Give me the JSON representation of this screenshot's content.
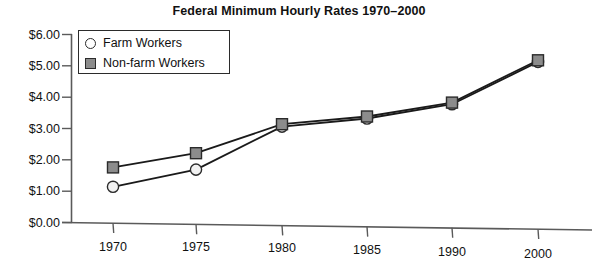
{
  "chart_data": {
    "type": "line",
    "title": "Federal Minimum Hourly Rates 1970–2000",
    "xlabel": "",
    "ylabel": "",
    "categories": [
      "1970",
      "1975",
      "1980",
      "1985",
      "1990",
      "2000"
    ],
    "series": [
      {
        "name": "Farm Workers",
        "marker": "open-circle",
        "marker_fill": "#f2f2f2",
        "marker_stroke": "#2b2b2b",
        "values": [
          1.3,
          1.8,
          3.1,
          3.35,
          3.8,
          5.15
        ]
      },
      {
        "name": "Non-farm Workers",
        "marker": "filled-square",
        "marker_fill": "#8c8c8c",
        "marker_stroke": "#2b2b2b",
        "values": [
          1.6,
          2.1,
          3.1,
          3.35,
          3.8,
          5.15
        ]
      }
    ],
    "ylim": [
      0,
      6
    ],
    "ytick_values": [
      0,
      1,
      2,
      3,
      4,
      5,
      6
    ],
    "ytick_labels": [
      "$0.00",
      "$1.00",
      "$2.00",
      "$3.00",
      "$4.00",
      "$5.00",
      "$6.00"
    ],
    "xtick_labels": [
      "1970",
      "1975",
      "1980",
      "1985",
      "1990",
      "2000"
    ],
    "grid": false,
    "legend_position": "top-left-inside",
    "line_color": "#1a1a1a",
    "axis_color": "#4a4a4a"
  },
  "legend": {
    "entries": [
      {
        "label": "Farm Workers",
        "marker": "open-circle"
      },
      {
        "label": "Non-farm Workers",
        "marker": "filled-square"
      }
    ]
  }
}
